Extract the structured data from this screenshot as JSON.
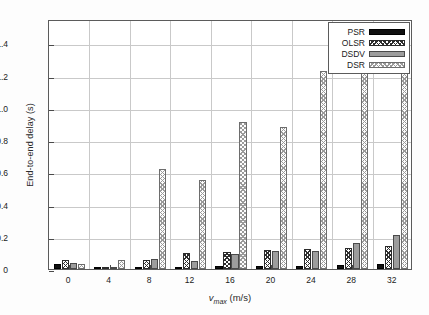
{
  "chart_data": {
    "type": "bar",
    "title": "",
    "xlabel": "v_max (m/s)",
    "xlabel_main": "v",
    "xlabel_sub": "max",
    "xlabel_unit": " (m/s)",
    "ylabel": "End-to-end delay (s)",
    "categories": [
      "0",
      "4",
      "8",
      "12",
      "16",
      "20",
      "24",
      "28",
      "32"
    ],
    "xtick_labels": [
      "0",
      "4",
      "8",
      "12",
      "16",
      "20",
      "24",
      "28",
      "32"
    ],
    "ytick_labels": [
      "0",
      "0.2",
      "0.4",
      "0.6",
      "0.8",
      "1.0",
      "1.2",
      "1.4"
    ],
    "ytick_values": [
      0,
      0.2,
      0.4,
      0.6,
      0.8,
      1.0,
      1.2,
      1.4
    ],
    "ylim": [
      0,
      1.55
    ],
    "grid": true,
    "legend_position": "top-right",
    "series": [
      {
        "name": "PSR",
        "fill": "solid-black",
        "color": "#101010",
        "values": [
          0.03,
          0.01,
          0.014,
          0.013,
          0.016,
          0.018,
          0.02,
          0.022,
          0.028
        ]
      },
      {
        "name": "OLSR",
        "fill": "crosshatch-dark",
        "color": "#2e2e2e",
        "values": [
          0.055,
          0.012,
          0.058,
          0.097,
          0.108,
          0.117,
          0.122,
          0.131,
          0.14
        ]
      },
      {
        "name": "DSDV",
        "fill": "solid-gray",
        "color": "#9d9d9d",
        "values": [
          0.038,
          0.015,
          0.062,
          0.049,
          0.096,
          0.112,
          0.112,
          0.164,
          0.208
        ]
      },
      {
        "name": "DSR",
        "fill": "crosshatch-light",
        "color": "#c8c8c8",
        "values": [
          0.034,
          0.058,
          0.62,
          0.551,
          0.91,
          0.879,
          1.23,
          1.29,
          1.408
        ]
      }
    ]
  },
  "legend": {
    "items": [
      {
        "label": "PSR",
        "fill": "psr"
      },
      {
        "label": "OLSR",
        "fill": "olsr"
      },
      {
        "label": "DSDV",
        "fill": "dsdv"
      },
      {
        "label": "DSR",
        "fill": "dsr"
      }
    ]
  }
}
